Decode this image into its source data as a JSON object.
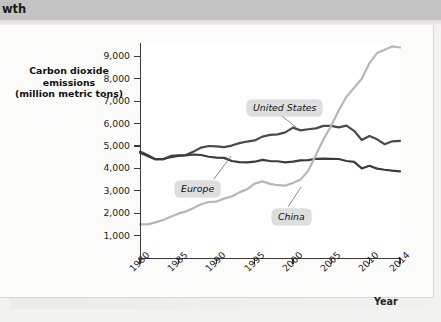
{
  "banner": {
    "heading_fragment": "wth"
  },
  "axis": {
    "y_title_line1": "Carbon dioxide emissions",
    "y_title_line2": "(million metric tons)",
    "x_title": "Year"
  },
  "chart_data": {
    "type": "line",
    "title": "",
    "xlabel": "Year",
    "ylabel": "Carbon dioxide emissions (million metric tons)",
    "xlim": [
      1980,
      2014
    ],
    "ylim": [
      0,
      9600
    ],
    "yticks": [
      1000,
      2000,
      3000,
      4000,
      5000,
      6000,
      7000,
      8000,
      9000
    ],
    "ytick_labels": [
      "1,000",
      "2,000",
      "3,000",
      "4,000",
      "5,000",
      "6,000",
      "7,000",
      "8,000",
      "9,000"
    ],
    "xticks": [
      1980,
      1985,
      1990,
      1995,
      2000,
      2005,
      2010,
      2014
    ],
    "xtick_labels": [
      "1980",
      "1985",
      "1990",
      "1995",
      "2000",
      "2005",
      "2010",
      "2014"
    ],
    "grid": false,
    "legend": "inline-callouts",
    "series": [
      {
        "name": "United States",
        "color": "#4a4a4a",
        "label_position": "above-line",
        "x": [
          1980,
          1981,
          1982,
          1983,
          1984,
          1985,
          1986,
          1987,
          1988,
          1989,
          1990,
          1991,
          1992,
          1993,
          1994,
          1995,
          1996,
          1997,
          1998,
          1999,
          2000,
          2001,
          2002,
          2003,
          2004,
          2005,
          2006,
          2007,
          2008,
          2009,
          2010,
          2011,
          2012,
          2013,
          2014
        ],
        "values": [
          4750,
          4600,
          4400,
          4400,
          4560,
          4580,
          4600,
          4750,
          4930,
          5000,
          4980,
          4950,
          5020,
          5130,
          5200,
          5250,
          5420,
          5500,
          5520,
          5610,
          5820,
          5700,
          5750,
          5790,
          5900,
          5900,
          5830,
          5910,
          5680,
          5270,
          5450,
          5300,
          5080,
          5210,
          5230
        ]
      },
      {
        "name": "Europe",
        "color": "#3c3c3c",
        "label_position": "below-line",
        "x": [
          1980,
          1981,
          1982,
          1983,
          1984,
          1985,
          1986,
          1987,
          1988,
          1989,
          1990,
          1991,
          1992,
          1993,
          1994,
          1995,
          1996,
          1997,
          1998,
          1999,
          2000,
          2001,
          2002,
          2003,
          2004,
          2005,
          2006,
          2007,
          2008,
          2009,
          2010,
          2011,
          2012,
          2013,
          2014
        ],
        "values": [
          4700,
          4550,
          4420,
          4420,
          4500,
          4560,
          4580,
          4620,
          4600,
          4520,
          4480,
          4470,
          4330,
          4280,
          4270,
          4300,
          4380,
          4330,
          4320,
          4270,
          4300,
          4360,
          4370,
          4430,
          4440,
          4430,
          4420,
          4330,
          4290,
          4000,
          4120,
          3990,
          3940,
          3900,
          3870
        ]
      },
      {
        "name": "China",
        "color": "#b7b7b7",
        "label_position": "below-line",
        "x": [
          1980,
          1981,
          1982,
          1983,
          1984,
          1985,
          1986,
          1987,
          1988,
          1989,
          1990,
          1991,
          1992,
          1993,
          1994,
          1995,
          1996,
          1997,
          1998,
          1999,
          2000,
          2001,
          2002,
          2003,
          2004,
          2005,
          2006,
          2007,
          2008,
          2009,
          2010,
          2011,
          2012,
          2013,
          2014
        ],
        "values": [
          1500,
          1500,
          1590,
          1690,
          1840,
          1980,
          2080,
          2230,
          2400,
          2500,
          2520,
          2650,
          2750,
          2930,
          3070,
          3320,
          3420,
          3310,
          3250,
          3230,
          3350,
          3500,
          3900,
          4600,
          5300,
          5900,
          6600,
          7200,
          7600,
          8000,
          8700,
          9150,
          9300,
          9450,
          9400
        ]
      }
    ]
  },
  "callouts": [
    {
      "id": "united-states",
      "text": "United States"
    },
    {
      "id": "europe",
      "text": "Europe"
    },
    {
      "id": "china",
      "text": "China"
    }
  ]
}
